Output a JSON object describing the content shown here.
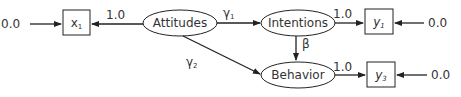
{
  "diagram": {
    "type": "path-model",
    "latent_nodes": [
      {
        "id": "attitudes",
        "label": "Attitudes"
      },
      {
        "id": "intentions",
        "label": "Intentions"
      },
      {
        "id": "behavior",
        "label": "Behavior"
      }
    ],
    "observed_nodes": [
      {
        "id": "x1",
        "base": "x",
        "sub": "1"
      },
      {
        "id": "y1",
        "base": "y",
        "sub": "1"
      },
      {
        "id": "y3",
        "base": "y",
        "sub": "3"
      }
    ],
    "edge_labels": {
      "attitudes_x1": "1.0",
      "intentions_y1": "1.0",
      "behavior_y3": "1.0",
      "gamma1": "γ",
      "gamma1_sub": "1",
      "gamma2": "γ",
      "gamma2_sub": "2",
      "beta": "β"
    },
    "error_labels": {
      "x1_error": "0.0",
      "y1_error": "0.0",
      "y3_error": "0.0"
    }
  }
}
